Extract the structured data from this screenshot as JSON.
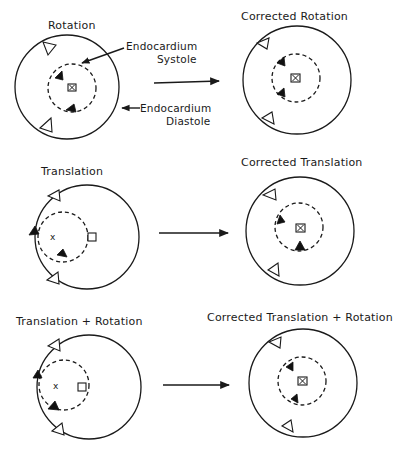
{
  "panels": {
    "rotation": {
      "title": "Rotation",
      "annotation_systole_line1": "Endocardium",
      "annotation_systole_line2": "Systole",
      "annotation_diastole_line1": "Endocardium",
      "annotation_diastole_line2": "Diastole"
    },
    "corrected_rotation": {
      "title": "Corrected Rotation"
    },
    "translation": {
      "title": "Translation",
      "center_mark": "x"
    },
    "corrected_translation": {
      "title": "Corrected Translation"
    },
    "translation_rotation": {
      "title": "Translation + Rotation",
      "center_mark": "x"
    },
    "corrected_translation_rotation": {
      "title": "Corrected Translation + Rotation"
    }
  },
  "colors": {
    "ink": "#1a1a1a",
    "background": "#ffffff"
  }
}
